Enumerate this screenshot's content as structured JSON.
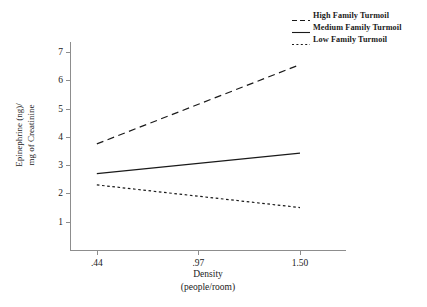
{
  "chart_data": {
    "type": "line",
    "title": "",
    "xlabel": "Density",
    "xlabel_sub": "(people/room)",
    "ylabel_line1": "Epinephrine (ng)/",
    "ylabel_line2": "mg of Creatinine",
    "categories": [
      ".44",
      ".97",
      "1.50"
    ],
    "x": [
      0.44,
      0.97,
      1.5
    ],
    "xtick_labels": [
      ".44",
      ".97",
      "1.50"
    ],
    "ytick_labels": [
      "7",
      "6",
      "5",
      "4",
      "3",
      "2",
      "1"
    ],
    "yticks": [
      7,
      6,
      5,
      4,
      3,
      2,
      1
    ],
    "ylim": [
      0,
      7.35
    ],
    "xlim": [
      0.3,
      1.74
    ],
    "grid": false,
    "legend_position": "top-right",
    "series": [
      {
        "name": "High Family Turmoil",
        "style": "long-dash",
        "color": "#1a1a1a",
        "values": [
          3.75,
          5.15,
          6.55
        ]
      },
      {
        "name": "Medium Family Turmoil",
        "style": "solid",
        "color": "#1a1a1a",
        "values": [
          2.7,
          3.06,
          3.42
        ]
      },
      {
        "name": "Low Family Turmoil",
        "style": "dotted",
        "color": "#1a1a1a",
        "values": [
          2.3,
          1.9,
          1.5
        ]
      }
    ]
  },
  "legend": {
    "items": [
      {
        "label": "High Family Turmoil",
        "style": "long-dash"
      },
      {
        "label": "Medium Family Turmoil",
        "style": "solid"
      },
      {
        "label": "Low Family Turmoil",
        "style": "dotted"
      }
    ]
  },
  "axes": {
    "y_title_line1": "Epinephrine (ng)/",
    "y_title_line2": "mg of Creatinine",
    "x_title_line1": "Density",
    "x_title_line2": "(people/room)"
  }
}
